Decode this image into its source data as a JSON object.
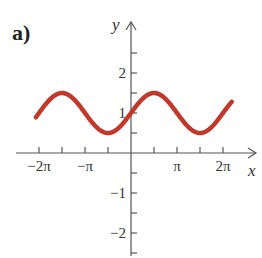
{
  "panel_label": "a)",
  "colors": {
    "curve": "#c0392b",
    "axis": "#555555",
    "text": "#333333"
  },
  "chart_data": {
    "type": "line",
    "title": "",
    "panel_label": "a)",
    "function": "y = 1 + 0.5 sin(x)",
    "xlabel": "x",
    "ylabel": "y",
    "xlim": [
      -6.75,
      7.3
    ],
    "ylim": [
      -2.6,
      3.3
    ],
    "grid": false,
    "legend": null,
    "x_ticks": [
      -6.2832,
      -4.7124,
      -3.1416,
      -1.5708,
      1.5708,
      3.1416,
      4.7124,
      6.2832
    ],
    "x_tick_labels": [
      {
        "value": -6.2832,
        "label": "−2π"
      },
      {
        "value": -3.1416,
        "label": "−π"
      },
      {
        "value": 3.1416,
        "label": "π"
      },
      {
        "value": 6.2832,
        "label": "2π"
      }
    ],
    "y_ticks": [
      -2.5,
      -2,
      -1.5,
      -1,
      -0.5,
      0.5,
      1,
      1.5,
      2,
      2.5
    ],
    "y_tick_labels": [
      {
        "value": 2,
        "label": "2"
      },
      {
        "value": 1,
        "label": "1"
      },
      {
        "value": -1,
        "label": "−1"
      },
      {
        "value": -2,
        "label": "−2"
      }
    ],
    "series": [
      {
        "name": "y = 1 + 0.5 sin x",
        "x_range": [
          -6.5,
          6.88
        ],
        "points": [
          {
            "x": -6.5,
            "y": 0.89
          },
          {
            "x": -4.7124,
            "y": 1.5
          },
          {
            "x": -3.1416,
            "y": 1.0
          },
          {
            "x": -1.5708,
            "y": 0.5
          },
          {
            "x": 0,
            "y": 1.0
          },
          {
            "x": 1.5708,
            "y": 1.5
          },
          {
            "x": 3.1416,
            "y": 1.0
          },
          {
            "x": 4.7124,
            "y": 0.5
          },
          {
            "x": 6.2832,
            "y": 1.0
          },
          {
            "x": 6.88,
            "y": 1.28
          }
        ]
      }
    ]
  }
}
